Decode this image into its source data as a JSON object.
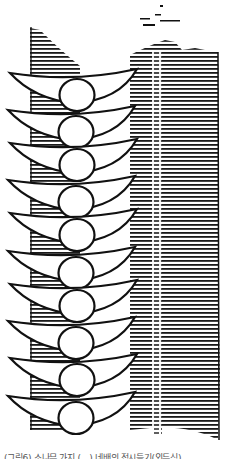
{
  "illustration": {
    "subject": "woodcut line drawing of stacked crescent-and-ball tiers against a hatched column",
    "tier_count": 10,
    "tiers_y": [
      73,
      110,
      143,
      180,
      213,
      251,
      284,
      321,
      358,
      396
    ],
    "colors": {
      "ink": "#111111",
      "paper": "#ffffff",
      "hatch": "#222222"
    }
  },
  "caption": {
    "text": "(그림6) 소나무 가지 (…) 네배의 접시들기(외두식)"
  }
}
